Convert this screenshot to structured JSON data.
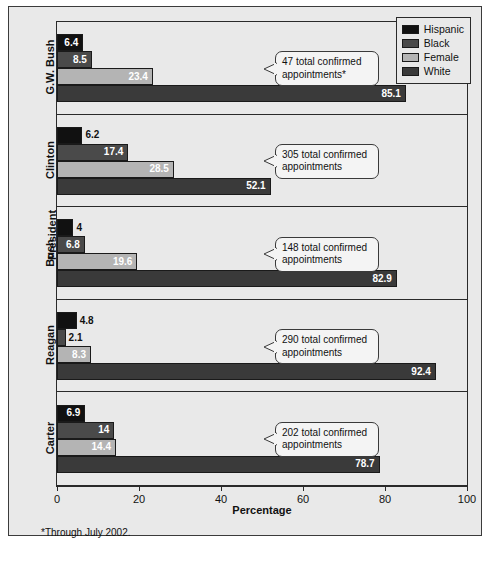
{
  "chart_data": {
    "type": "bar",
    "orientation": "horizontal",
    "title": "",
    "xlabel": "Percentage",
    "ylabel": "President",
    "xlim": [
      0,
      100
    ],
    "xticks": [
      0,
      20,
      40,
      60,
      80,
      100
    ],
    "grid": false,
    "legend_position": "top-right",
    "categories": [
      "G.W. Bush",
      "Clinton",
      "Bush",
      "Reagan",
      "Carter"
    ],
    "series": [
      {
        "name": "Hispanic",
        "color": "#111111",
        "values": [
          6.4,
          6.2,
          4,
          4.8,
          6.9
        ]
      },
      {
        "name": "Black",
        "color": "#4a4a4a",
        "values": [
          8.5,
          17.4,
          6.8,
          2.1,
          14
        ]
      },
      {
        "name": "Female",
        "color": "#b4b4b4",
        "values": [
          23.4,
          28.5,
          19.6,
          8.3,
          14.4
        ]
      },
      {
        "name": "White",
        "color": "#3a3a3a",
        "values": [
          85.1,
          52.1,
          82.9,
          92.4,
          78.7
        ]
      }
    ],
    "value_labels": [
      [
        "6.4",
        "8.5",
        "23.4",
        "85.1"
      ],
      [
        "6.2",
        "17.4",
        "28.5",
        "52.1"
      ],
      [
        "4",
        "6.8",
        "19.6",
        "82.9"
      ],
      [
        "4.8",
        "2.1",
        "8.3",
        "92.4"
      ],
      [
        "6.9",
        "14",
        "14.4",
        "78.7"
      ]
    ],
    "annotations": [
      "47 total confirmed appointments*",
      "305 total confirmed appointments",
      "148 total confirmed appointments",
      "290 total confirmed appointments",
      "202 total confirmed appointments"
    ],
    "footnote": "*Through July 2002."
  },
  "legend": {
    "items": [
      {
        "label": "Hispanic"
      },
      {
        "label": "Black"
      },
      {
        "label": "Female"
      },
      {
        "label": "White"
      }
    ]
  },
  "axis": {
    "ticklabels": [
      "0",
      "20",
      "40",
      "60",
      "80",
      "100"
    ],
    "xtitle": "Percentage",
    "ytitle": "President"
  },
  "groups": [
    {
      "label": "G.W. Bush"
    },
    {
      "label": "Clinton"
    },
    {
      "label": "Bush"
    },
    {
      "label": "Reagan"
    },
    {
      "label": "Carter"
    }
  ],
  "footnote": {
    "text": "*Through July 2002."
  }
}
